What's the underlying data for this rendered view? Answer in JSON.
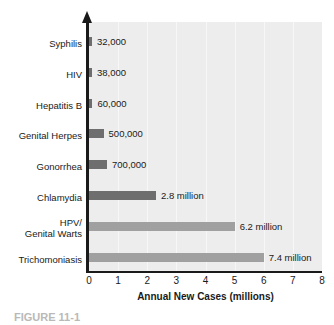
{
  "chart_data": {
    "type": "bar",
    "orientation": "horizontal",
    "title": "",
    "xlabel": "Annual New Cases (millions)",
    "ylabel": "",
    "xlim": [
      0,
      8
    ],
    "xticks": [
      "0",
      "1",
      "2",
      "3",
      "4",
      "5",
      "6",
      "7",
      "8"
    ],
    "grid": true,
    "legend": null,
    "categories": [
      "Syphilis",
      "HIV",
      "Hepatitis B",
      "Genital Herpes",
      "Gonorrhea",
      "Chlamydia",
      "HPV/\nGenital Warts",
      "Trichomoniasis"
    ],
    "values": [
      0.032,
      0.038,
      0.06,
      0.5,
      0.7,
      2.8,
      6.2,
      7.4
    ],
    "value_labels": [
      "32,000",
      "38,000",
      "60,000",
      "500,000",
      "700,000",
      "2.8 million",
      "6.2 million",
      "7.4 million"
    ],
    "drawn_lengths_axis_units": [
      0.1,
      0.1,
      0.12,
      0.5,
      0.62,
      2.3,
      5.0,
      6.0
    ],
    "bar_colors": [
      "#6e6e6e",
      "#6e6e6e",
      "#6e6e6e",
      "#6e6e6e",
      "#6e6e6e",
      "#6e6e6e",
      "#a0a0a0",
      "#a0a0a0"
    ],
    "plot_background": "#ededed",
    "axis_color": "#1a1a1a"
  },
  "caption": {
    "text": "FIGURE 11-1"
  }
}
